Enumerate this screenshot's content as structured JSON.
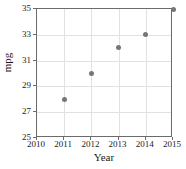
{
  "chart_data": {
    "type": "scatter",
    "title": "",
    "xlabel": "Year",
    "ylabel": "mpg",
    "x": [
      2011,
      2012,
      2013,
      2014,
      2015
    ],
    "values": [
      28,
      30,
      32,
      33,
      35
    ],
    "points": [
      {
        "x": 2011,
        "y": 28
      },
      {
        "x": 2012,
        "y": 30
      },
      {
        "x": 2013,
        "y": 32
      },
      {
        "x": 2014,
        "y": 33
      },
      {
        "x": 2015,
        "y": 35
      }
    ],
    "xlim": [
      2010,
      2015
    ],
    "ylim": [
      25,
      35
    ],
    "xticks": [
      "2010",
      "2011",
      "2012",
      "2013",
      "2014",
      "2015"
    ],
    "yticks": [
      "25",
      "27",
      "29",
      "31",
      "33",
      "35"
    ],
    "grid": true,
    "legend": null,
    "marker_color": "#767676",
    "grid_color": "#e2e2e2",
    "axis_color": "#6b6b6b"
  }
}
